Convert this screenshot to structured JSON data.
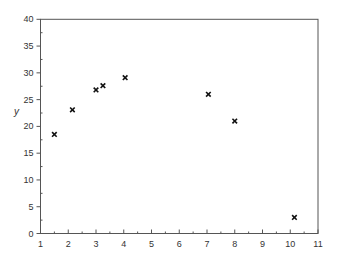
{
  "chart_data": {
    "type": "scatter",
    "title": "",
    "xlabel": "",
    "ylabel": "y",
    "xlim": [
      1,
      11
    ],
    "ylim": [
      0,
      40
    ],
    "grid": false,
    "legend": null,
    "marker": "x",
    "x_ticks": [
      1,
      2,
      3,
      4,
      5,
      6,
      7,
      8,
      9,
      10,
      11
    ],
    "y_ticks": [
      0,
      5,
      10,
      15,
      20,
      25,
      30,
      35,
      40
    ],
    "series": [
      {
        "name": "data",
        "points": [
          {
            "x": 1.5,
            "y": 18.5
          },
          {
            "x": 2.15,
            "y": 23.1
          },
          {
            "x": 3.0,
            "y": 26.8
          },
          {
            "x": 3.25,
            "y": 27.6
          },
          {
            "x": 4.05,
            "y": 29.1
          },
          {
            "x": 7.05,
            "y": 26.0
          },
          {
            "x": 8.0,
            "y": 21.0
          },
          {
            "x": 10.15,
            "y": 3.0
          }
        ]
      }
    ]
  }
}
